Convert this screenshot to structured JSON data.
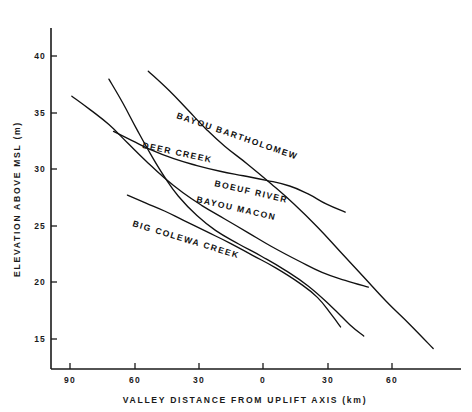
{
  "chart_data": {
    "type": "line",
    "title": "",
    "xlabel": "VALLEY DISTANCE FROM UPLIFT AXIS (km)",
    "ylabel": "ELEVATION ABOVE MSL (m)",
    "grid": false,
    "legend_position": "inline-curve-labels",
    "xtick_labels": [
      "90",
      "60",
      "30",
      "0",
      "30",
      "60"
    ],
    "xtick_values": [
      -90,
      -60,
      -30,
      0,
      30,
      60
    ],
    "ytick_labels": [
      "40",
      "35",
      "30",
      "25",
      "20",
      "15"
    ],
    "ytick_values": [
      40,
      35,
      30,
      25,
      20,
      15
    ],
    "xlim": [
      -99,
      78
    ],
    "ylim": [
      12.5,
      42.5
    ],
    "series": [
      {
        "name": "BAYOU BARTHOLOMEW",
        "points": [
          [
            -57,
            38.7
          ],
          [
            -48,
            37.0
          ],
          [
            -40,
            35.3
          ],
          [
            -32,
            33.6
          ],
          [
            -24,
            32.1
          ],
          [
            -14,
            30.5
          ],
          [
            -4,
            28.8
          ],
          [
            6,
            27.0
          ],
          [
            16,
            25.0
          ],
          [
            26,
            22.8
          ],
          [
            36,
            20.6
          ],
          [
            46,
            18.4
          ],
          [
            56,
            16.4
          ],
          [
            66,
            14.3
          ]
        ]
      },
      {
        "name": "DEER CREEK",
        "points": [
          [
            -72,
            33.4
          ],
          [
            -64,
            32.6
          ],
          [
            -56,
            31.8
          ],
          [
            -46,
            31.0
          ],
          [
            -36,
            30.4
          ],
          [
            -26,
            29.9
          ],
          [
            -16,
            29.5
          ],
          [
            -6,
            29.1
          ],
          [
            4,
            28.6
          ],
          [
            12,
            27.9
          ],
          [
            20,
            27.0
          ],
          [
            28,
            26.3
          ]
        ]
      },
      {
        "name": "BOEUF RIVER",
        "points": [
          [
            -90,
            36.5
          ],
          [
            -82,
            35.3
          ],
          [
            -74,
            34.0
          ],
          [
            -66,
            32.4
          ],
          [
            -58,
            30.8
          ],
          [
            -50,
            29.3
          ],
          [
            -42,
            28.0
          ],
          [
            -34,
            26.9
          ],
          [
            -24,
            25.7
          ],
          [
            -14,
            24.5
          ],
          [
            -4,
            23.3
          ],
          [
            8,
            22.0
          ],
          [
            18,
            21.0
          ],
          [
            28,
            20.3
          ],
          [
            38,
            19.7
          ]
        ]
      },
      {
        "name": "BAYOU MACON",
        "points": [
          [
            -74,
            38.0
          ],
          [
            -68,
            35.9
          ],
          [
            -62,
            33.6
          ],
          [
            -56,
            31.4
          ],
          [
            -50,
            29.4
          ],
          [
            -44,
            27.7
          ],
          [
            -36,
            26.0
          ],
          [
            -28,
            24.7
          ],
          [
            -18,
            23.5
          ],
          [
            -8,
            22.4
          ],
          [
            2,
            21.2
          ],
          [
            12,
            19.8
          ],
          [
            22,
            18.0
          ],
          [
            30,
            16.4
          ],
          [
            36,
            15.4
          ]
        ]
      },
      {
        "name": "BIG COLEWA CREEK",
        "points": [
          [
            -66,
            27.8
          ],
          [
            -58,
            27.1
          ],
          [
            -50,
            26.4
          ],
          [
            -42,
            25.6
          ],
          [
            -32,
            24.6
          ],
          [
            -22,
            23.6
          ],
          [
            -12,
            22.5
          ],
          [
            -2,
            21.4
          ],
          [
            8,
            20.1
          ],
          [
            16,
            18.8
          ],
          [
            22,
            17.3
          ],
          [
            26,
            16.2
          ]
        ]
      }
    ],
    "curve_label_text": {
      "bayou_bartholomew": "BAYOU BARTHOLOMEW",
      "deer_creek": "DEER CREEK",
      "boeuf_river": "BOEUF RIVER",
      "bayou_macon": "BAYOU MACON",
      "big_colewa_creek": "BIG COLEWA CREEK"
    }
  }
}
